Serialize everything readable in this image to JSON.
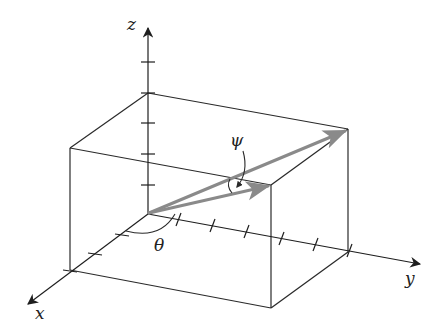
{
  "figure": {
    "type": "3d-coordinate-diagram",
    "colors": {
      "line": "#2a2a2a",
      "vector": "#8a8a8a",
      "background": "#ffffff"
    }
  },
  "axes": {
    "x": {
      "label": "x"
    },
    "y": {
      "label": "y"
    },
    "z": {
      "label": "z"
    }
  },
  "angles": {
    "theta": {
      "label": "θ"
    },
    "psi": {
      "label": "ψ"
    }
  },
  "vectors": [
    {
      "name": "diagonal-vector",
      "description": "origin to far top corner of box"
    },
    {
      "name": "face-vector",
      "description": "origin to top-front corner projection"
    }
  ],
  "ticks": {
    "z": 5,
    "y": 6,
    "x": 3
  }
}
